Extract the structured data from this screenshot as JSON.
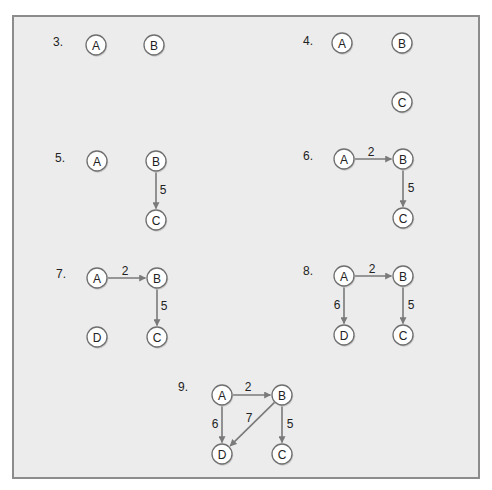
{
  "colors": {
    "frame_bg": "#ececec",
    "frame_border": "#8c8c8c",
    "node_fill": "#ffffff",
    "node_stroke": "#6f6f6f",
    "edge": "#7a7a7a",
    "text": "#222222"
  },
  "node_radius": 10,
  "panels": [
    {
      "id": "3",
      "label": "3.",
      "label_pos": [
        53,
        46
      ],
      "nodes": [
        {
          "name": "A",
          "x": 96,
          "y": 45
        },
        {
          "name": "B",
          "x": 154,
          "y": 45
        }
      ],
      "edges": []
    },
    {
      "id": "4",
      "label": "4.",
      "label_pos": [
        303,
        45
      ],
      "nodes": [
        {
          "name": "A",
          "x": 342,
          "y": 43
        },
        {
          "name": "B",
          "x": 402,
          "y": 43
        },
        {
          "name": "C",
          "x": 402,
          "y": 102
        }
      ],
      "edges": []
    },
    {
      "id": "5",
      "label": "5.",
      "label_pos": [
        55,
        162
      ],
      "nodes": [
        {
          "name": "A",
          "x": 97,
          "y": 161
        },
        {
          "name": "B",
          "x": 156,
          "y": 161
        },
        {
          "name": "C",
          "x": 156,
          "y": 220
        }
      ],
      "edges": [
        {
          "from": "B",
          "to": "C",
          "weight": "5",
          "label_pos": [
            163,
            190
          ]
        }
      ]
    },
    {
      "id": "6",
      "label": "6.",
      "label_pos": [
        303,
        160
      ],
      "nodes": [
        {
          "name": "A",
          "x": 344,
          "y": 159
        },
        {
          "name": "B",
          "x": 403,
          "y": 159
        },
        {
          "name": "C",
          "x": 403,
          "y": 218
        }
      ],
      "edges": [
        {
          "from": "A",
          "to": "B",
          "weight": "2",
          "label_pos": [
            371,
            152
          ]
        },
        {
          "from": "B",
          "to": "C",
          "weight": "5",
          "label_pos": [
            411,
            188
          ]
        }
      ]
    },
    {
      "id": "7",
      "label": "7.",
      "label_pos": [
        56,
        278
      ],
      "nodes": [
        {
          "name": "A",
          "x": 97,
          "y": 278
        },
        {
          "name": "B",
          "x": 157,
          "y": 278
        },
        {
          "name": "D",
          "x": 97,
          "y": 337
        },
        {
          "name": "C",
          "x": 157,
          "y": 337
        }
      ],
      "edges": [
        {
          "from": "A",
          "to": "B",
          "weight": "2",
          "label_pos": [
            125,
            271
          ]
        },
        {
          "from": "B",
          "to": "C",
          "weight": "5",
          "label_pos": [
            164,
            306
          ]
        }
      ]
    },
    {
      "id": "8",
      "label": "8.",
      "label_pos": [
        303,
        275
      ],
      "nodes": [
        {
          "name": "A",
          "x": 344,
          "y": 276
        },
        {
          "name": "B",
          "x": 403,
          "y": 276
        },
        {
          "name": "D",
          "x": 344,
          "y": 335
        },
        {
          "name": "C",
          "x": 403,
          "y": 335
        }
      ],
      "edges": [
        {
          "from": "A",
          "to": "B",
          "weight": "2",
          "label_pos": [
            372,
            269
          ]
        },
        {
          "from": "A",
          "to": "D",
          "weight": "6",
          "label_pos": [
            337,
            305
          ]
        },
        {
          "from": "B",
          "to": "C",
          "weight": "5",
          "label_pos": [
            411,
            305
          ]
        }
      ]
    },
    {
      "id": "9",
      "label": "9.",
      "label_pos": [
        178,
        391
      ],
      "nodes": [
        {
          "name": "A",
          "x": 222,
          "y": 395
        },
        {
          "name": "B",
          "x": 282,
          "y": 395
        },
        {
          "name": "D",
          "x": 222,
          "y": 454
        },
        {
          "name": "C",
          "x": 282,
          "y": 454
        }
      ],
      "edges": [
        {
          "from": "A",
          "to": "B",
          "weight": "2",
          "label_pos": [
            248,
            387
          ]
        },
        {
          "from": "A",
          "to": "D",
          "weight": "6",
          "label_pos": [
            215,
            424
          ]
        },
        {
          "from": "B",
          "to": "D",
          "weight": "7",
          "label_pos": [
            249,
            418
          ]
        },
        {
          "from": "B",
          "to": "C",
          "weight": "5",
          "label_pos": [
            290,
            424
          ]
        }
      ]
    }
  ]
}
